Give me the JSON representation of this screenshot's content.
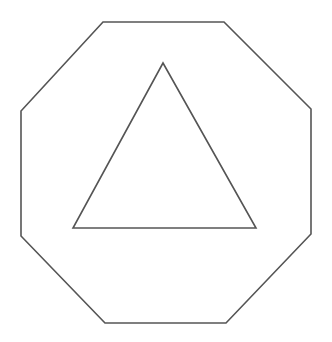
{
  "canvas": {
    "width": 332,
    "height": 342,
    "background": "#ffffff"
  },
  "style": {
    "stroke_color": "#555555",
    "stroke_width": 1.6
  },
  "shapes": {
    "octagon": {
      "type": "octagon",
      "points": "103,22 224,22 311,109 311,234 226,323 105,323 21,236 21,111"
    },
    "triangle": {
      "type": "triangle",
      "points": "163,63 256,228 73,228"
    }
  }
}
